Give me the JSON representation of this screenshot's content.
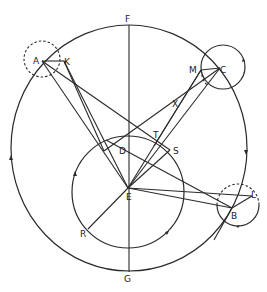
{
  "figure": {
    "labels": {
      "F": "F",
      "G": "G",
      "A": "A",
      "K": "K",
      "M": "M",
      "C": "C",
      "X": "X",
      "T": "T",
      "D": "D",
      "S": "S",
      "E": "E",
      "B": "B",
      "L": "L",
      "R": "R"
    },
    "colors": {
      "stroke": "#2a2a2a",
      "background": "#ffffff"
    },
    "points": {
      "F": [
        129,
        25
      ],
      "G": [
        129,
        272
      ],
      "E": [
        128,
        188
      ],
      "D": [
        128,
        150
      ],
      "A": [
        42,
        60
      ],
      "K": [
        64,
        61
      ],
      "C": [
        220,
        68
      ],
      "M": [
        201,
        70
      ],
      "B": [
        232,
        208
      ],
      "L": [
        252,
        196
      ],
      "T": [
        155,
        137
      ],
      "S": [
        170,
        150
      ],
      "X": [
        178,
        103
      ],
      "R": [
        88,
        229
      ]
    },
    "circles": {
      "outer": {
        "cx": 129,
        "cy": 148,
        "rx": 118,
        "ry": 123
      },
      "inner": {
        "cx": 128,
        "cy": 192,
        "r": 56
      },
      "epicycle_A": {
        "cx": 42,
        "cy": 59,
        "r": 18,
        "style": "dashed"
      },
      "epicycle_C": {
        "cx": 223,
        "cy": 67,
        "r": 22,
        "style": "solid"
      },
      "epicycle_B": {
        "cx": 238,
        "cy": 205,
        "r": 21,
        "style": "partly-dashed"
      }
    }
  }
}
